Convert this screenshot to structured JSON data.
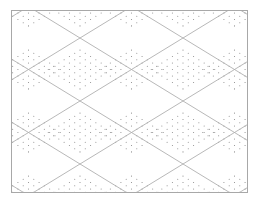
{
  "canvas": {
    "width": 255,
    "height": 211,
    "background": "#ffffff"
  },
  "frame": {
    "x": 11,
    "y": 10,
    "width": 237,
    "height": 183,
    "stroke": "#a8a8a8"
  },
  "lattice": {
    "stroke": "#b0b0b0",
    "cell_width": 103,
    "cell_height": 63,
    "origin_x": 80,
    "origin_y": 38
  },
  "dots": {
    "color": "#8a8a8a",
    "radius": 0.55,
    "step_along": 6.2,
    "inner_scale": 0.62
  }
}
